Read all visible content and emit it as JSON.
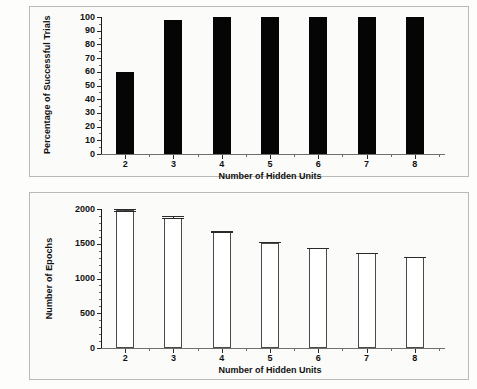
{
  "figure": {
    "background": "#fdfdfc",
    "panel_background": "#fbfbfa",
    "frame_color": "#b9b9b9"
  },
  "chart_data": [
    {
      "id": "top",
      "type": "bar",
      "title": "",
      "xlabel": "Number of Hidden Units",
      "ylabel": "Percentage of Successful Trials",
      "categories": [
        "2",
        "3",
        "4",
        "5",
        "6",
        "7",
        "8"
      ],
      "values": [
        60,
        98,
        100,
        100,
        100,
        100,
        100
      ],
      "ylim": [
        0,
        100
      ],
      "yticks": [
        0,
        10,
        20,
        30,
        40,
        50,
        60,
        70,
        80,
        90,
        100
      ],
      "ytick_labels": [
        "0",
        "10",
        "20",
        "30",
        "40",
        "50",
        "60",
        "70",
        "80",
        "90",
        "100"
      ],
      "xtick_labels": [
        "2",
        "3",
        "4",
        "5",
        "6",
        "7",
        "8"
      ],
      "bar_color": "#050505",
      "bar_style": "filled",
      "grid": false,
      "legend": false
    },
    {
      "id": "bottom",
      "type": "bar",
      "title": "",
      "xlabel": "Number of Hidden Units",
      "ylabel": "Number of Epochs",
      "categories": [
        "2",
        "3",
        "4",
        "5",
        "6",
        "7",
        "8"
      ],
      "values": [
        1985,
        1875,
        1675,
        1515,
        1435,
        1365,
        1310
      ],
      "errors": [
        35,
        25,
        15,
        10,
        8,
        6,
        6
      ],
      "ylim": [
        0,
        2000
      ],
      "yticks": [
        0,
        500,
        1000,
        1500,
        2000
      ],
      "ytick_labels": [
        "0",
        "500",
        "1000",
        "1500",
        "2000"
      ],
      "xtick_labels": [
        "2",
        "3",
        "4",
        "5",
        "6",
        "7",
        "8"
      ],
      "bar_color": "#ffffff",
      "bar_edge_color": "#4a4a4a",
      "bar_style": "open",
      "grid": false,
      "legend": false
    }
  ]
}
